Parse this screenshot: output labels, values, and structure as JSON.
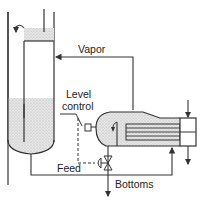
{
  "diagram": {
    "labels": {
      "vapor": "Vapor",
      "level": "Level",
      "control": "control",
      "feed": "Feed",
      "bottoms": "Bottoms"
    },
    "components": [
      "column",
      "downcomer",
      "kettle-reboiler",
      "tube-bundle",
      "weir",
      "level-controller",
      "control-valve",
      "channel-head"
    ],
    "colors": {
      "line": "#333333",
      "liquid": "#dcdcdc",
      "background": "#ffffff"
    }
  }
}
